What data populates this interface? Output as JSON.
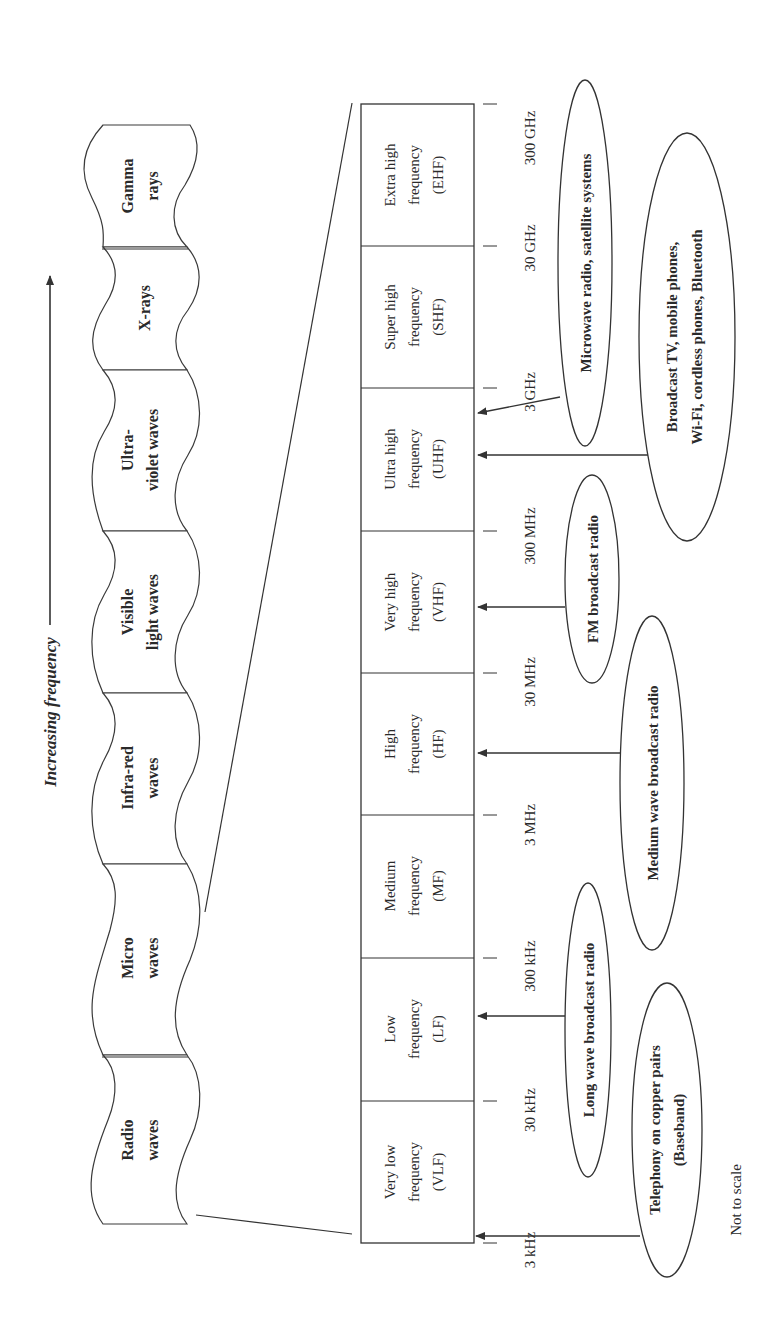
{
  "diagram": {
    "axis_label": "Increasing frequency",
    "footnote": "Not to scale",
    "spectrum": [
      {
        "id": "radio",
        "line1": "Radio",
        "line2": "waves",
        "y0": 1055,
        "y1": 1224
      },
      {
        "id": "micro",
        "line1": "Micro",
        "line2": "waves",
        "y0": 864,
        "y1": 1055
      },
      {
        "id": "infrared",
        "line1": "Infra-red",
        "line2": "waves",
        "y0": 693,
        "y1": 864
      },
      {
        "id": "visible",
        "line1": "Visible",
        "line2": "light waves",
        "y0": 531,
        "y1": 693
      },
      {
        "id": "ultraviolet",
        "line1": "Ultra-",
        "line2": "violet waves",
        "y0": 370,
        "y1": 531
      },
      {
        "id": "xrays",
        "line1": "X-rays",
        "line2": "",
        "y0": 247,
        "y1": 370
      },
      {
        "id": "gamma",
        "line1": "Gamma",
        "line2": "rays",
        "y0": 125,
        "y1": 247
      }
    ],
    "bands": [
      {
        "id": "vlf",
        "line1": "Very low",
        "line2": "frequency",
        "line3": "(VLF)"
      },
      {
        "id": "lf",
        "line1": "Low",
        "line2": "frequency",
        "line3": "(LF)"
      },
      {
        "id": "mf",
        "line1": "Medium",
        "line2": "frequency",
        "line3": "(MF)"
      },
      {
        "id": "hf",
        "line1": "High",
        "line2": "frequency",
        "line3": "(HF)"
      },
      {
        "id": "vhf",
        "line1": "Very high",
        "line2": "frequency",
        "line3": "(VHF)"
      },
      {
        "id": "uhf",
        "line1": "Ultra high",
        "line2": "frequency",
        "line3": "(UHF)"
      },
      {
        "id": "shf",
        "line1": "Super high",
        "line2": "frequency",
        "line3": "(SHF)"
      },
      {
        "id": "ehf",
        "line1": "Extra high",
        "line2": "frequency",
        "line3": "(EHF)"
      }
    ],
    "boundaries": [
      "3 kHz",
      "30 kHz",
      "300 kHz",
      "3 MHz",
      "30 MHz",
      "300 MHz",
      "3 GHz",
      "30 GHz",
      "300 GHz"
    ],
    "applications": [
      {
        "id": "telephony",
        "line1": "Telephony on copper pairs",
        "line2": "(Baseband)",
        "target_band": "VLF"
      },
      {
        "id": "longwave",
        "line1": "Long wave broadcast radio",
        "line2": "",
        "target_band": "LF"
      },
      {
        "id": "mediumwave",
        "line1": "Medium wave broadcast  radio",
        "line2": "",
        "target_band": "MF"
      },
      {
        "id": "fm",
        "line1": "FM broadcast radio",
        "line2": "",
        "target_band": "VHF"
      },
      {
        "id": "broadcast_tv",
        "line1": "Broadcast TV, mobile phones,",
        "line2": "Wi-Fi, cordless phones, Bluetooth",
        "target_band": "UHF"
      },
      {
        "id": "microwave_radio",
        "line1": "Microwave radio, satellite systems",
        "line2": "",
        "target_band": "SHF"
      }
    ]
  }
}
